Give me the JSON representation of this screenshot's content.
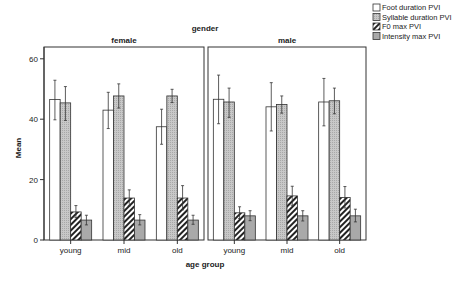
{
  "chart_data": {
    "type": "bar",
    "title": "gender",
    "xlabel": "age group",
    "ylabel": "Mean",
    "ylim": [
      0,
      63
    ],
    "yticks": [
      0,
      20,
      40,
      60
    ],
    "grid": false,
    "legend_position": "top-right",
    "panels": [
      "female",
      "male"
    ],
    "categories": [
      "young",
      "mid",
      "old"
    ],
    "series": [
      {
        "name": "Foot duration PVI",
        "pattern": "white",
        "values": {
          "female": [
            46.5,
            43.0,
            37.5
          ],
          "male": [
            46.6,
            44.1,
            45.7
          ]
        },
        "err_high": {
          "female": [
            52.9,
            48.9,
            43.3
          ],
          "male": [
            54.6,
            52.1,
            53.5
          ]
        },
        "err_low": {
          "female": [
            39.8,
            36.9,
            31.7
          ],
          "male": [
            38.5,
            36.1,
            37.8
          ]
        }
      },
      {
        "name": "Syllable duration PVI",
        "pattern": "light-gray-dots",
        "values": {
          "female": [
            45.4,
            47.7,
            47.7
          ],
          "male": [
            45.7,
            44.9,
            46.1
          ]
        },
        "err_high": {
          "female": [
            50.8,
            51.7,
            49.9
          ],
          "male": [
            50.3,
            47.7,
            50.3
          ]
        },
        "err_low": {
          "female": [
            39.6,
            43.7,
            45.5
          ],
          "male": [
            40.6,
            42.0,
            41.8
          ]
        }
      },
      {
        "name": "F0 max PVI",
        "pattern": "diagonal-hatch",
        "values": {
          "female": [
            9.3,
            13.9,
            13.9
          ],
          "male": [
            9.0,
            14.6,
            14.1
          ]
        },
        "err_high": {
          "female": [
            11.4,
            16.6,
            18.0
          ],
          "male": [
            11.0,
            17.8,
            17.7
          ]
        },
        "err_low": {
          "female": [
            7.4,
            11.3,
            10.0
          ],
          "male": [
            7.1,
            11.5,
            10.6
          ]
        }
      },
      {
        "name": "Intensity max PVI",
        "pattern": "medium-gray",
        "values": {
          "female": [
            6.6,
            6.6,
            6.6
          ],
          "male": [
            8.0,
            8.0,
            8.0
          ]
        },
        "err_high": {
          "female": [
            8.2,
            8.4,
            8.2
          ],
          "male": [
            9.7,
            9.7,
            10.2
          ]
        },
        "err_low": {
          "female": [
            5.0,
            5.0,
            5.2
          ],
          "male": [
            6.4,
            6.3,
            6.0
          ]
        }
      }
    ]
  }
}
